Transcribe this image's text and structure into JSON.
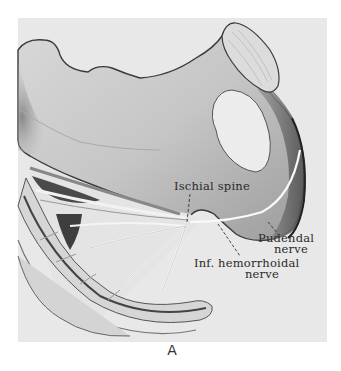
{
  "figure": {
    "letter": "A",
    "labels": {
      "ischial_spine": "Ischial spine",
      "pudendal_nerve_line1": "Pudendal",
      "pudendal_nerve_line2": "nerve",
      "inf_hemorrhoidal_line1": "Inf. hemorrhoidal",
      "inf_hemorrhoidal_line2": "nerve"
    },
    "colors": {
      "panel_bg": "#e8e8e8",
      "bone_fill": "#cfcfcf",
      "bone_shadow": "#8a8a8a",
      "outline": "#333333",
      "foramen": "#ededed",
      "nerve": "#f4f4f4"
    }
  }
}
